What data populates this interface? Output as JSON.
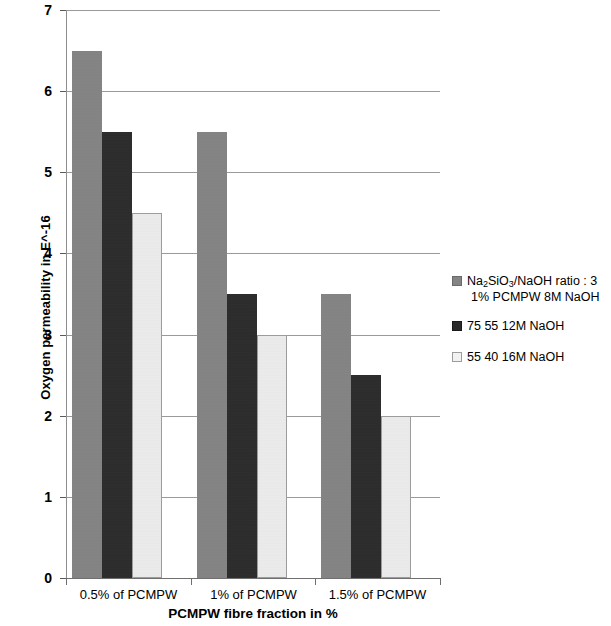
{
  "chart_data": {
    "type": "bar",
    "title": "",
    "subtitle": "",
    "xlabel": "PCMPW fibre fraction in %",
    "ylabel": "Oxygen permeability in E^-16",
    "categories": [
      "0.5% of PCMPW",
      "1% of PCMPW",
      "1.5% of PCMPW"
    ],
    "series": [
      {
        "name": "Na2SiO3/NaOH ratio : 3  1% PCMPW 8M NaOH",
        "values": [
          6.5,
          5.5,
          3.5
        ],
        "color": "#848484"
      },
      {
        "name": "75 55 12M NaOH",
        "values": [
          5.5,
          3.5,
          2.5
        ],
        "color": "#2b2b2b"
      },
      {
        "name": "55 40 16M NaOH",
        "values": [
          4.5,
          3.0,
          2.0
        ],
        "color": "#ededed"
      }
    ],
    "ylim": [
      0,
      7
    ],
    "ytick_labels": [
      "0",
      "1",
      "2",
      "3",
      "4",
      "5",
      "6",
      "7"
    ],
    "ytick_values": [
      0,
      1,
      2,
      3,
      4,
      5,
      6,
      7
    ],
    "grid": true,
    "grid_axis": "y",
    "legend_position": "right"
  },
  "axes": {
    "y_title": "Oxygen permeability in E^-16",
    "x_title": "PCMPW fibre fraction in %",
    "y_ticks": [
      {
        "label": "7",
        "value": 7
      },
      {
        "label": "6",
        "value": 6
      },
      {
        "label": "5",
        "value": 5
      },
      {
        "label": "4",
        "value": 4
      },
      {
        "label": "3",
        "value": 3
      },
      {
        "label": "2",
        "value": 2
      },
      {
        "label": "1",
        "value": 1
      },
      {
        "label": "0",
        "value": 0
      }
    ],
    "categories": [
      {
        "label": "0.5% of PCMPW"
      },
      {
        "label": "1% of PCMPW"
      },
      {
        "label": "1.5% of PCMPW"
      }
    ]
  },
  "legend": {
    "entries": [
      {
        "line1_prefix": "Na",
        "line1_sub1": "2",
        "line1_mid": "SiO",
        "line1_sub2": "3",
        "line1_suffix": "/NaOH ratio : 3",
        "line2": "1% PCMPW 8M NaOH",
        "swatch": "#848484"
      },
      {
        "label": "75 55 12M NaOH",
        "swatch": "#2b2b2b"
      },
      {
        "label": "55 40 16M NaOH",
        "swatch": "#ededed"
      }
    ]
  }
}
